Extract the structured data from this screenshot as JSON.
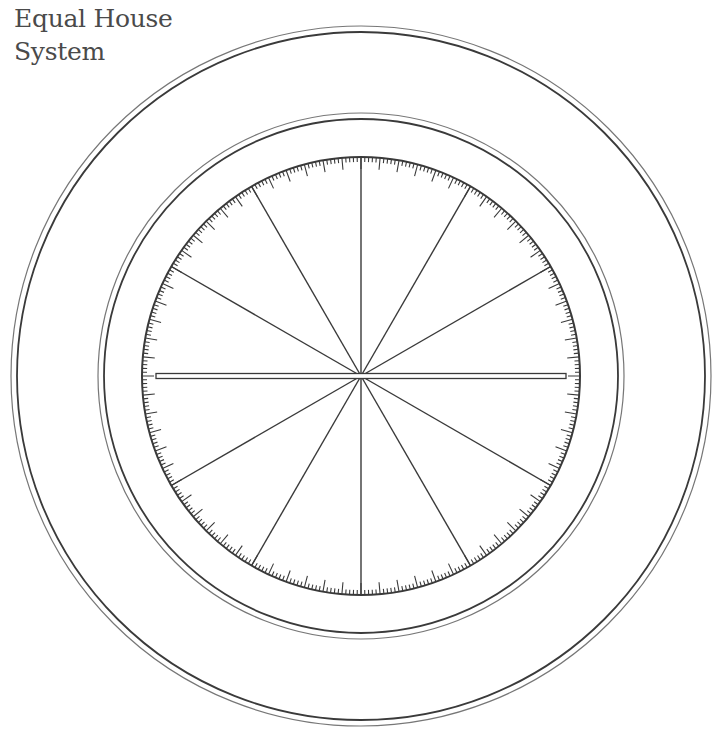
{
  "title": {
    "line1": "Equal House",
    "line2": "System"
  },
  "wheel": {
    "center": [
      361,
      376
    ],
    "outer_ring": {
      "outer_r": 350,
      "inner_r": 344
    },
    "middle_ring": {
      "outer_r": 263,
      "inner_r": 257
    },
    "degree_circle": {
      "r": 219
    },
    "house_spokes": 12,
    "tick_minor_len": 5,
    "tick_major_len": 12,
    "tick_major_every": 5,
    "axis_half_width": 2.5,
    "stroke_color": "#3a3a3a"
  }
}
